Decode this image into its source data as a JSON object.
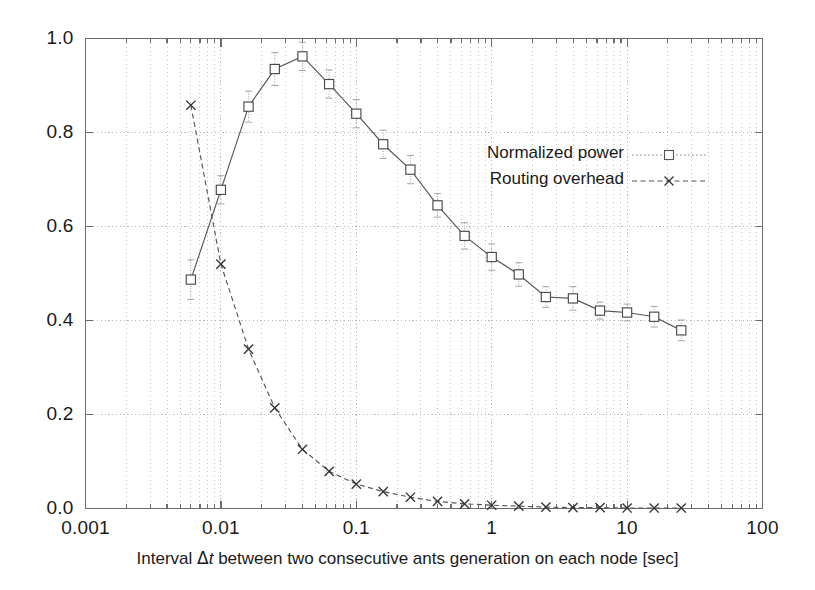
{
  "chart_data": {
    "type": "line",
    "title": "",
    "subtitle": "",
    "xlabel_parts": {
      "before": "Interval ",
      "delta": "Δ",
      "italic_var": "t",
      "after": " between two consecutive ants generation on each node [sec]"
    },
    "xlabel": "Interval Δt between two consecutive ants generation on each node [sec]",
    "ylabel": "",
    "xscale": "log",
    "yscale": "linear",
    "xlim": [
      0.001,
      100
    ],
    "ylim": [
      0.0,
      1.0
    ],
    "grid": true,
    "grid_style": "dotted",
    "legend_position": "inside-upper-right",
    "xticks": [
      {
        "value": 0.001,
        "label": "0.001"
      },
      {
        "value": 0.01,
        "label": "0.01"
      },
      {
        "value": 0.1,
        "label": "0.1"
      },
      {
        "value": 1,
        "label": "1"
      },
      {
        "value": 10,
        "label": "10"
      },
      {
        "value": 100,
        "label": "100"
      }
    ],
    "yticks": [
      {
        "value": 0.0,
        "label": "0.0"
      },
      {
        "value": 0.2,
        "label": "0.2"
      },
      {
        "value": 0.4,
        "label": "0.4"
      },
      {
        "value": 0.6,
        "label": "0.6"
      },
      {
        "value": 0.8,
        "label": "0.8"
      },
      {
        "value": 1.0,
        "label": "1.0"
      }
    ],
    "series": [
      {
        "name": "Normalized power",
        "marker": "open-square",
        "linestyle": "solid",
        "color": "#555555",
        "has_error_bars": true,
        "points": [
          {
            "x": 0.006,
            "y": 0.487,
            "err": 0.042
          },
          {
            "x": 0.01,
            "y": 0.678,
            "err": 0.03
          },
          {
            "x": 0.016,
            "y": 0.855,
            "err": 0.033
          },
          {
            "x": 0.025,
            "y": 0.935,
            "err": 0.035
          },
          {
            "x": 0.04,
            "y": 0.962,
            "err": 0.03
          },
          {
            "x": 0.063,
            "y": 0.903,
            "err": 0.03
          },
          {
            "x": 0.1,
            "y": 0.84,
            "err": 0.03
          },
          {
            "x": 0.158,
            "y": 0.775,
            "err": 0.03
          },
          {
            "x": 0.251,
            "y": 0.721,
            "err": 0.03
          },
          {
            "x": 0.398,
            "y": 0.645,
            "err": 0.025
          },
          {
            "x": 0.631,
            "y": 0.58,
            "err": 0.028
          },
          {
            "x": 1.0,
            "y": 0.535,
            "err": 0.028
          },
          {
            "x": 1.585,
            "y": 0.498,
            "err": 0.025
          },
          {
            "x": 2.512,
            "y": 0.45,
            "err": 0.022
          },
          {
            "x": 3.981,
            "y": 0.447,
            "err": 0.025
          },
          {
            "x": 6.31,
            "y": 0.421,
            "err": 0.018
          },
          {
            "x": 10.0,
            "y": 0.417,
            "err": 0.018
          },
          {
            "x": 15.849,
            "y": 0.408,
            "err": 0.022
          },
          {
            "x": 25.119,
            "y": 0.379,
            "err": 0.022
          }
        ]
      },
      {
        "name": "Routing overhead",
        "marker": "cross",
        "linestyle": "dashed",
        "color": "#555555",
        "has_error_bars": false,
        "points": [
          {
            "x": 0.006,
            "y": 0.858
          },
          {
            "x": 0.01,
            "y": 0.52
          },
          {
            "x": 0.016,
            "y": 0.339
          },
          {
            "x": 0.025,
            "y": 0.214
          },
          {
            "x": 0.04,
            "y": 0.126
          },
          {
            "x": 0.063,
            "y": 0.079
          },
          {
            "x": 0.1,
            "y": 0.052
          },
          {
            "x": 0.158,
            "y": 0.036
          },
          {
            "x": 0.251,
            "y": 0.024
          },
          {
            "x": 0.398,
            "y": 0.015
          },
          {
            "x": 0.631,
            "y": 0.01
          },
          {
            "x": 1.0,
            "y": 0.007
          },
          {
            "x": 1.585,
            "y": 0.005
          },
          {
            "x": 2.512,
            "y": 0.003
          },
          {
            "x": 3.981,
            "y": 0.002
          },
          {
            "x": 6.31,
            "y": 0.002
          },
          {
            "x": 10.0,
            "y": 0.001
          },
          {
            "x": 15.849,
            "y": 0.001
          },
          {
            "x": 25.119,
            "y": 0.001
          }
        ]
      }
    ]
  },
  "legend": {
    "entries": [
      {
        "label": "Normalized power",
        "marker": "open-square",
        "linestyle": "dotted"
      },
      {
        "label": "Routing overhead",
        "marker": "cross",
        "linestyle": "dashed"
      }
    ]
  },
  "colors": {
    "background": "#ffffff",
    "axis": "#6b6b6b",
    "grid": "#b9b9b9",
    "series": "#555555",
    "text": "#1a1a1a"
  }
}
